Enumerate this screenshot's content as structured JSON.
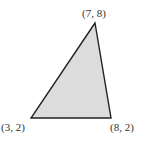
{
  "diagram": {
    "type": "triangle",
    "fill_color": "#dcdcdc",
    "stroke_color": "#222222",
    "vertices": [
      {
        "label": "(7, 8)",
        "x": 7,
        "y": 8,
        "px": [
          95,
          23
        ]
      },
      {
        "label": "(3, 2)",
        "x": 3,
        "y": 2,
        "px": [
          31,
          118
        ]
      },
      {
        "label": "(8, 2)",
        "x": 8,
        "y": 2,
        "px": [
          111,
          118
        ]
      }
    ]
  }
}
